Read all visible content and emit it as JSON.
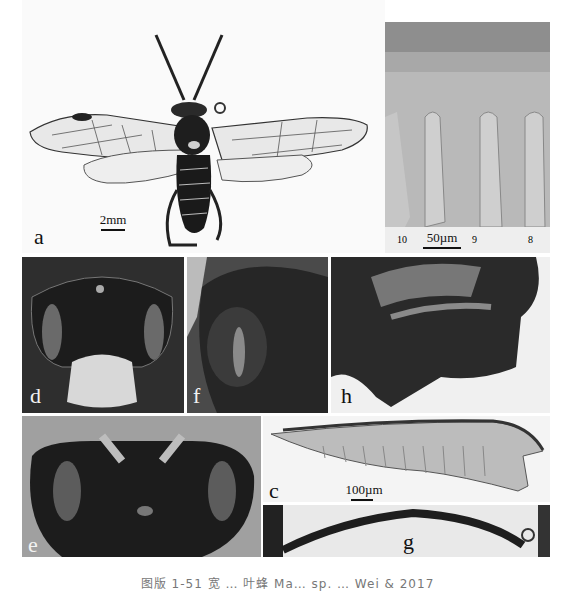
{
  "figure": {
    "panels": [
      {
        "id": "a",
        "label": "a",
        "description": "habitus, dorsal view",
        "scale": "2mm"
      },
      {
        "id": "b",
        "label": "b",
        "description": "sawteeth detail",
        "scale": "50µm",
        "tooth_numbers": [
          "10",
          "9",
          "8"
        ]
      },
      {
        "id": "d",
        "label": "d",
        "description": "head, frontal view"
      },
      {
        "id": "f",
        "label": "f",
        "description": "mesopleuron"
      },
      {
        "id": "h",
        "label": "h",
        "description": "genitalia / abdomen apex"
      },
      {
        "id": "e",
        "label": "e",
        "description": "head, dorsal view"
      },
      {
        "id": "c",
        "label": "c",
        "description": "lancet",
        "scale": "100µm"
      },
      {
        "id": "g",
        "label": "g",
        "description": "antenna"
      }
    ],
    "caption": "图版 1-51  宽 … 叶蜂 Ma… sp. … Wei & 2017"
  }
}
